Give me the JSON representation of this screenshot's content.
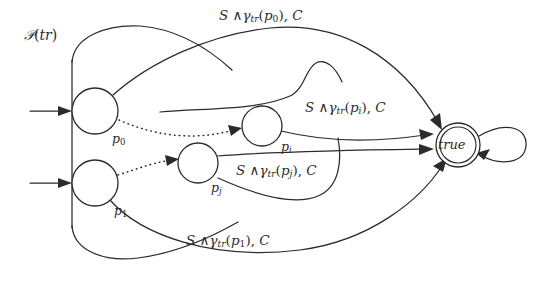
{
  "diagram": {
    "title_label": "P(tr)",
    "accepting_state_label": "true",
    "states": [
      {
        "id": "p0",
        "label": "p",
        "subscript": "0",
        "cx": 95,
        "cy": 111,
        "r": 23,
        "kind": "normal",
        "initial": true
      },
      {
        "id": "p1",
        "label": "p",
        "subscript": "1",
        "cx": 95,
        "cy": 183,
        "r": 23,
        "kind": "normal",
        "initial": true
      },
      {
        "id": "pj",
        "label": "p",
        "subscript": "j",
        "cx": 198,
        "cy": 163,
        "r": 20,
        "kind": "normal",
        "initial": false
      },
      {
        "id": "pi",
        "label": "p",
        "subscript": "i",
        "cx": 262,
        "cy": 126,
        "r": 20,
        "kind": "normal",
        "initial": false
      },
      {
        "id": "true",
        "label": "true",
        "subscript": "",
        "cx": 458,
        "cy": 145,
        "r": 22,
        "kind": "accepting",
        "initial": false
      }
    ],
    "transitions": [
      {
        "id": "t-p0",
        "from": "p0",
        "to": "true",
        "guard": "S",
        "conj": "∧",
        "gamma": "γ",
        "gamma_sub": "tr",
        "arg": "p",
        "arg_sub": "0",
        "action": "C",
        "label_text": "S ∧ γtr(p0), C"
      },
      {
        "id": "t-pi",
        "from": "pi",
        "to": "true",
        "guard": "S",
        "conj": "∧",
        "gamma": "γ",
        "gamma_sub": "tr",
        "arg": "p",
        "arg_sub": "i",
        "action": "C",
        "label_text": "S ∧ γtr(pi), C"
      },
      {
        "id": "t-pj",
        "from": "pj",
        "to": "true",
        "guard": "S",
        "conj": "∧",
        "gamma": "γ",
        "gamma_sub": "tr",
        "arg": "p",
        "arg_sub": "j",
        "action": "C",
        "label_text": "S ∧ γtr(pj), C"
      },
      {
        "id": "t-p1",
        "from": "p1",
        "to": "true",
        "guard": "S",
        "conj": "∧",
        "gamma": "γ",
        "gamma_sub": "tr",
        "arg": "p",
        "arg_sub": "1",
        "action": "C",
        "label_text": "S ∧ γtr(p1), C"
      }
    ],
    "dotted_paths": [
      {
        "id": "d-p0-pi",
        "from": "p0",
        "to": "pi"
      },
      {
        "id": "d-p1-pj",
        "from": "p1",
        "to": "pj"
      }
    ],
    "self_loop": {
      "id": "loop-true",
      "on": "true"
    },
    "colors": {
      "ink": "#2b2b2b",
      "paper": "#ffffff"
    }
  }
}
